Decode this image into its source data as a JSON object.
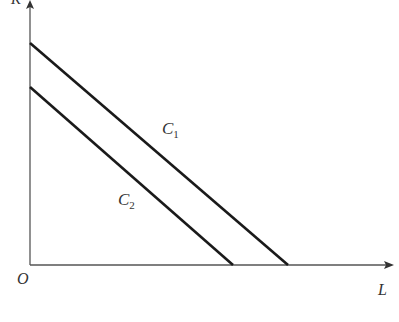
{
  "diagram": {
    "axes": {
      "y_label": "K",
      "x_label": "L",
      "origin_label": "O"
    },
    "curves": [
      {
        "id": "C1",
        "label_main": "C",
        "label_sub": "1",
        "y_intercept_px": [
          30,
          43
        ],
        "x_intercept_px": [
          288,
          265
        ]
      },
      {
        "id": "C2",
        "label_main": "C",
        "label_sub": "2",
        "y_intercept_px": [
          30,
          87
        ],
        "x_intercept_px": [
          233,
          265
        ]
      }
    ],
    "colors": {
      "axis": "#555555",
      "curve": "#1a1a1a",
      "text": "#333333"
    },
    "caption": ""
  }
}
